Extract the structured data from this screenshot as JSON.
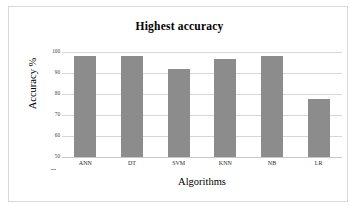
{
  "chart_data": {
    "type": "bar",
    "title": "Highest accuracy",
    "xlabel": "Algorithms",
    "ylabel": "Accuracy %",
    "categories": [
      "ANN",
      "DT",
      "SVM",
      "KNN",
      "NB",
      "LR"
    ],
    "values": [
      98.0,
      98.3,
      91.8,
      96.5,
      98.0,
      77.8
    ],
    "ylim": [
      50,
      100
    ],
    "yticks": [
      50,
      60,
      70,
      80,
      90,
      100
    ],
    "ytick_labels": [
      "50",
      "60",
      "70",
      "80",
      "90",
      "100"
    ],
    "grid": true,
    "legend": "none",
    "bar_color": "#8c8c8c",
    "gridline_color": "#d6d6d6",
    "background_color": "#ffffff",
    "frame_color": "#d9d9d9"
  }
}
